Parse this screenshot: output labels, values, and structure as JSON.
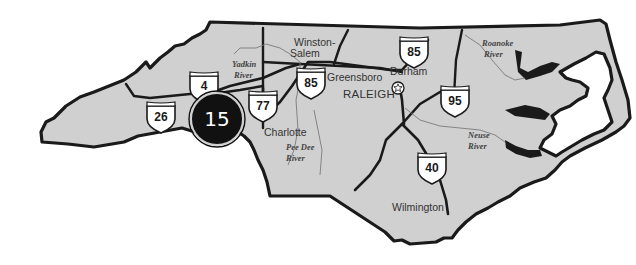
{
  "map": {
    "region": "North Carolina",
    "colors": {
      "land": "#d0d0d0",
      "outline": "#1a1a1a",
      "river": "#7a7a7a",
      "marker_fill": "#111111",
      "marker_text": "#ffffff",
      "background": "#ffffff"
    },
    "cities": [
      {
        "name": "Winston-",
        "name2": "Salem"
      },
      {
        "name": "Greensboro"
      },
      {
        "name": "Durham"
      },
      {
        "name": "RALEIGH",
        "capital": true
      },
      {
        "name": "Charlotte"
      },
      {
        "name": "Wilmington"
      }
    ],
    "rivers": [
      {
        "line1": "Yadkin",
        "line2": "River"
      },
      {
        "line1": "Roanoke",
        "line2": "River"
      },
      {
        "line1": "Pee Dee",
        "line2": "River"
      },
      {
        "line1": "Neuse",
        "line2": "River"
      }
    ],
    "interstates": [
      {
        "number": "26"
      },
      {
        "number": "40",
        "partially_hidden": true,
        "label": "4"
      },
      {
        "number": "77"
      },
      {
        "number": "85",
        "location": "west"
      },
      {
        "number": "85",
        "location": "north"
      },
      {
        "number": "95"
      },
      {
        "number": "40",
        "location": "east"
      }
    ],
    "marker": {
      "label": "15",
      "icon": "map-cluster-marker"
    },
    "capital_icon": "star-in-circle-icon"
  }
}
